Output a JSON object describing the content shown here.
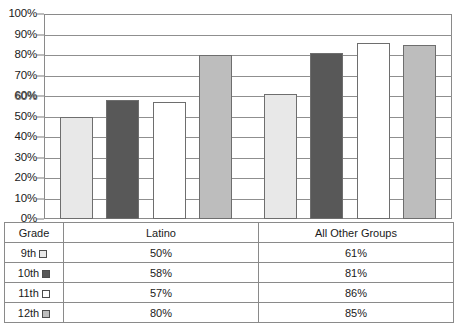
{
  "chart_data": {
    "type": "bar",
    "title": "",
    "xlabel": "",
    "ylabel": "",
    "categories": [
      "Latino",
      "All Other Groups"
    ],
    "series": [
      {
        "name": "9th",
        "values": [
          50,
          61
        ],
        "color": "#e8e8e8",
        "swatch": "light-gray-swatch"
      },
      {
        "name": "10th",
        "values": [
          58,
          81
        ],
        "color": "#585858",
        "swatch": "dark-gray-swatch"
      },
      {
        "name": "11th",
        "values": [
          57,
          86
        ],
        "color": "#ffffff",
        "swatch": "white-swatch"
      },
      {
        "name": "12th",
        "values": [
          80,
          85
        ],
        "color": "#bdbdbd",
        "swatch": "medium-gray-swatch"
      }
    ],
    "ylim": [
      0,
      100
    ],
    "ytick_labels": [
      "100%",
      "90%",
      "80%",
      "70%",
      "60%",
      "50%",
      "40%",
      "30%",
      "20%",
      "10%",
      "0%"
    ],
    "ytick_values": [
      100,
      90,
      80,
      70,
      60,
      50,
      40,
      30,
      20,
      10,
      0
    ],
    "grid": true,
    "legend_position": "table-row-labels"
  },
  "table": {
    "grade_header": "Grade",
    "category_headers": [
      "Latino",
      "All Other Groups"
    ],
    "rows": [
      {
        "grade": "9th",
        "latino": "50%",
        "all_other": "61%"
      },
      {
        "grade": "10th",
        "latino": "58%",
        "all_other": "81%"
      },
      {
        "grade": "11th",
        "latino": "57%",
        "all_other": "86%"
      },
      {
        "grade": "12th",
        "latino": "80%",
        "all_other": "85%"
      }
    ]
  },
  "colors": {
    "axis": "#8a8a8a",
    "gridline": "#8f8f8f",
    "bar_outline": "#6e6e6e",
    "text": "#1a1a1a"
  }
}
